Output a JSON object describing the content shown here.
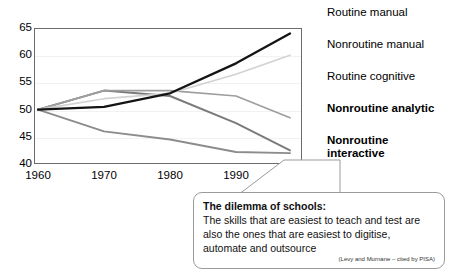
{
  "chart_data": {
    "type": "line",
    "title": "",
    "xlabel": "",
    "ylabel": "",
    "x": [
      1960,
      1970,
      1980,
      1990,
      2002
    ],
    "xtick_labels": [
      "1960",
      "1970",
      "1980",
      "1990",
      "2002"
    ],
    "ytick_labels": [
      "40",
      "45",
      "50",
      "55",
      "60",
      "65"
    ],
    "yticks": [
      40,
      45,
      50,
      55,
      60,
      65
    ],
    "ylim": [
      40,
      65
    ],
    "grid": true,
    "legend_position": "right",
    "series": [
      {
        "name": "Routine manual",
        "color": "#8c8c8c",
        "bold": false,
        "width": 1.9,
        "values": [
          50,
          46,
          44.5,
          42.2,
          42
        ]
      },
      {
        "name": "Nonroutine manual",
        "color": "#7a7a7a",
        "bold": false,
        "width": 1.9,
        "values": [
          50,
          53.5,
          52.5,
          47.5,
          42.5
        ]
      },
      {
        "name": "Routine cognitive",
        "color": "#9e9e9e",
        "bold": false,
        "width": 1.7,
        "values": [
          50,
          53.5,
          53.5,
          52.5,
          48.5
        ]
      },
      {
        "name": "Nonroutine analytic",
        "color": "#d2d2d2",
        "bold": true,
        "width": 1.7,
        "values": [
          50,
          52,
          53,
          56.5,
          60
        ]
      },
      {
        "name": "Nonroutine interactive",
        "color": "#141414",
        "bold": true,
        "width": 2.3,
        "values": [
          50,
          50.5,
          53,
          58.5,
          64
        ]
      }
    ]
  },
  "legend": {
    "entries": [
      {
        "label": "Routine manual",
        "color": "#8c8c8c",
        "bold": false
      },
      {
        "label": "Nonroutine manual",
        "color": "#7a7a7a",
        "bold": false
      },
      {
        "label": "Routine cognitive",
        "color": "#9e9e9e",
        "bold": false
      },
      {
        "label": "Nonroutine analytic",
        "color": "#d2d2d2",
        "bold": true
      },
      {
        "label": "Nonroutine\ninteractive",
        "color": "#141414",
        "bold": true
      }
    ]
  },
  "callout": {
    "title": "The dilemma of schools:",
    "body": "The skills that are easiest to teach and test are also the ones that are easiest to digitise, automate and outsource",
    "source": "(Levy and Murnane – cited by PISA)"
  }
}
